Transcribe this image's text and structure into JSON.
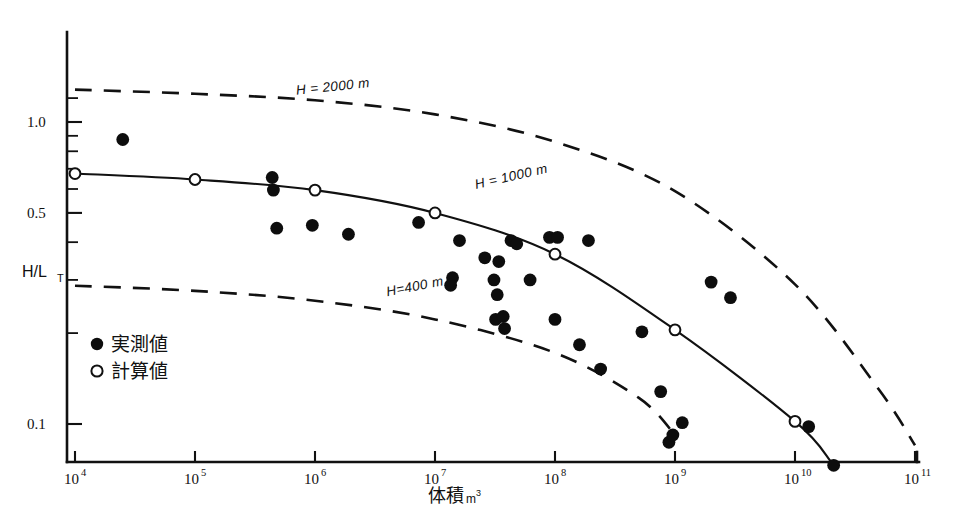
{
  "chart_data": {
    "type": "scatter",
    "title": "",
    "xlabel": "体積m³",
    "xlabel_main": "体積",
    "xlabel_unit": "m",
    "xlabel_unit_exp": "3",
    "ylabel": "H/L_T",
    "ylabel_main": "H/L",
    "ylabel_sub": "T",
    "xscale": "log",
    "yscale": "log",
    "xlim": [
      10000,
      100000000000
    ],
    "ylim": [
      0.08,
      1.45
    ],
    "grid": false,
    "legend_position": "inner-left-lower",
    "x_tick_labels": [
      "10⁴",
      "10⁵",
      "10⁶",
      "10⁷",
      "10⁸",
      "10⁹",
      "10¹⁰",
      "10¹¹"
    ],
    "x_ticks": [
      10000,
      100000,
      1000000,
      10000000,
      100000000,
      1000000000,
      10000000000,
      100000000000
    ],
    "x_tick_base": [
      "10",
      "10",
      "10",
      "10",
      "10",
      "10",
      "10",
      "10"
    ],
    "x_tick_exp": [
      "4",
      "5",
      "6",
      "7",
      "8",
      "9",
      "10",
      "11"
    ],
    "y_ticks_labeled": [
      {
        "value": 1.0,
        "label": "1.0"
      },
      {
        "value": 0.5,
        "label": "0.5"
      },
      {
        "value": 0.1,
        "label": "0.1"
      }
    ],
    "y_ticks_minor": [
      1.2,
      0.9,
      0.8,
      0.7,
      0.6,
      0.4,
      0.3,
      0.2
    ],
    "legend": [
      {
        "marker": "filled-circle",
        "label": "実測値"
      },
      {
        "marker": "open-circle",
        "label": "計算値"
      }
    ],
    "annotations": [
      {
        "text": "H = 2000 m",
        "x": 700000,
        "y": 1.23
      },
      {
        "text": "H = 1000 m",
        "x": 22000000,
        "y": 0.6
      },
      {
        "text": "H=400 m",
        "x": 4000000,
        "y": 0.265
      }
    ],
    "series": [
      {
        "name": "H = 2000 m",
        "type": "line",
        "style": "dashed",
        "points": [
          {
            "x": 10000,
            "y": 1.28
          },
          {
            "x": 100000,
            "y": 1.24
          },
          {
            "x": 1000000,
            "y": 1.18
          },
          {
            "x": 10000000,
            "y": 1.06
          },
          {
            "x": 100000000,
            "y": 0.86
          },
          {
            "x": 1000000000,
            "y": 0.59
          },
          {
            "x": 10000000000,
            "y": 0.29
          },
          {
            "x": 50000000000,
            "y": 0.13
          },
          {
            "x": 100000000000,
            "y": 0.085
          }
        ]
      },
      {
        "name": "H = 1000 m",
        "type": "line",
        "style": "solid",
        "points": [
          {
            "x": 10000,
            "y": 0.675
          },
          {
            "x": 100000,
            "y": 0.645
          },
          {
            "x": 1000000,
            "y": 0.595
          },
          {
            "x": 10000000,
            "y": 0.5
          },
          {
            "x": 100000000,
            "y": 0.365
          },
          {
            "x": 1000000000,
            "y": 0.205
          },
          {
            "x": 10000000000,
            "y": 0.102
          },
          {
            "x": 20000000000,
            "y": 0.075
          }
        ],
        "node_markers": [
          {
            "x": 10000,
            "y": 0.675
          },
          {
            "x": 100000,
            "y": 0.645
          },
          {
            "x": 1000000,
            "y": 0.595
          },
          {
            "x": 10000000,
            "y": 0.5
          },
          {
            "x": 100000000,
            "y": 0.365
          },
          {
            "x": 1000000000,
            "y": 0.205
          },
          {
            "x": 10000000000,
            "y": 0.102
          }
        ]
      },
      {
        "name": "H = 400 m",
        "type": "line",
        "style": "dashed",
        "points": [
          {
            "x": 10000,
            "y": 0.287
          },
          {
            "x": 100000,
            "y": 0.276
          },
          {
            "x": 1000000,
            "y": 0.256
          },
          {
            "x": 10000000,
            "y": 0.222
          },
          {
            "x": 100000000,
            "y": 0.172
          },
          {
            "x": 500000000,
            "y": 0.122
          },
          {
            "x": 1000000000,
            "y": 0.092
          }
        ]
      },
      {
        "name": "実測値",
        "type": "scatter",
        "marker": "filled-circle",
        "points": [
          {
            "x": 25000,
            "y": 0.875
          },
          {
            "x": 440000,
            "y": 0.655
          },
          {
            "x": 450000,
            "y": 0.595
          },
          {
            "x": 480000,
            "y": 0.445
          },
          {
            "x": 950000,
            "y": 0.455
          },
          {
            "x": 1900000,
            "y": 0.425
          },
          {
            "x": 7300000,
            "y": 0.465
          },
          {
            "x": 16000000.0,
            "y": 0.405
          },
          {
            "x": 26000000.0,
            "y": 0.355
          },
          {
            "x": 34000000.0,
            "y": 0.345
          },
          {
            "x": 14000000.0,
            "y": 0.305
          },
          {
            "x": 13500000.0,
            "y": 0.288
          },
          {
            "x": 31000000.0,
            "y": 0.3
          },
          {
            "x": 33000000.0,
            "y": 0.268
          },
          {
            "x": 43000000.0,
            "y": 0.405
          },
          {
            "x": 48000000.0,
            "y": 0.395
          },
          {
            "x": 62000000.0,
            "y": 0.3
          },
          {
            "x": 90000000.0,
            "y": 0.415
          },
          {
            "x": 105000000.0,
            "y": 0.415
          },
          {
            "x": 190000000.0,
            "y": 0.405
          },
          {
            "x": 32000000.0,
            "y": 0.222
          },
          {
            "x": 37000000.0,
            "y": 0.227
          },
          {
            "x": 38000000.0,
            "y": 0.207
          },
          {
            "x": 100000000.0,
            "y": 0.222
          },
          {
            "x": 160000000.0,
            "y": 0.183
          },
          {
            "x": 240000000.0,
            "y": 0.152
          },
          {
            "x": 530000000.0,
            "y": 0.202
          },
          {
            "x": 760000000.0,
            "y": 0.128
          },
          {
            "x": 1150000000.0,
            "y": 0.101
          },
          {
            "x": 890000000.0,
            "y": 0.087
          },
          {
            "x": 960000000.0,
            "y": 0.092
          },
          {
            "x": 2000000000.0,
            "y": 0.295
          },
          {
            "x": 2900000000.0,
            "y": 0.262
          },
          {
            "x": 13000000000.0,
            "y": 0.098
          },
          {
            "x": 21000000000.0,
            "y": 0.073
          }
        ]
      },
      {
        "name": "計算値",
        "type": "scatter",
        "marker": "open-circle",
        "points": [
          {
            "x": 10000,
            "y": 0.675
          },
          {
            "x": 100000,
            "y": 0.645
          },
          {
            "x": 1000000,
            "y": 0.595
          },
          {
            "x": 10000000,
            "y": 0.5
          },
          {
            "x": 100000000,
            "y": 0.365
          },
          {
            "x": 1000000000,
            "y": 0.205
          },
          {
            "x": 10000000000,
            "y": 0.102
          }
        ]
      }
    ]
  }
}
